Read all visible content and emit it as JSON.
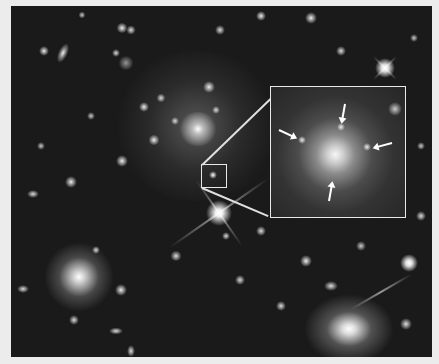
{
  "figure": {
    "description": "Deep-field image of a galaxy cluster with a small square region highlighted and enlarged in an inset panel; four arrows in the inset point to faint objects surrounding a central bright galaxy.",
    "colors": {
      "page_border": "#ececec",
      "sky_background": "#1a1a1a",
      "highlight_outline": "#e8e8e8",
      "arrows": "#ffffff"
    },
    "inset": {
      "label": "Enlarged inset",
      "arrow_count": 4
    },
    "highlight_box": {
      "label": "Zoom region"
    }
  }
}
